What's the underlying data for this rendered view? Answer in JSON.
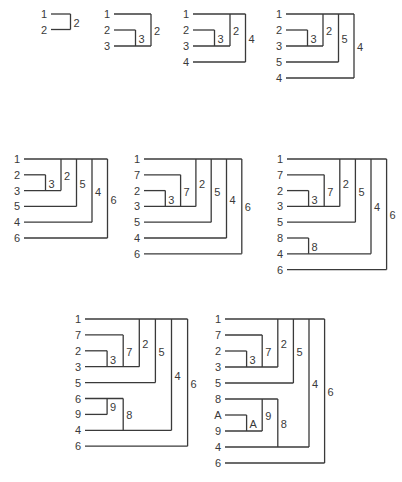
{
  "title": "",
  "diagrams": [
    {
      "rows": [
        "1",
        "2"
      ],
      "brackets": [
        {
          "label": "2",
          "top": 0,
          "bottom": 1,
          "level": 1
        }
      ]
    },
    {
      "rows": [
        "1",
        "2",
        "3"
      ],
      "brackets": [
        {
          "label": "3",
          "top": 1,
          "bottom": 2,
          "level": 1
        },
        {
          "label": "2",
          "top": 0,
          "bottom": 2,
          "level": 2
        }
      ]
    },
    {
      "rows": [
        "1",
        "2",
        "3",
        "4"
      ],
      "brackets": [
        {
          "label": "3",
          "top": 1,
          "bottom": 2,
          "level": 1
        },
        {
          "label": "2",
          "top": 0,
          "bottom": 2,
          "level": 2
        },
        {
          "label": "4",
          "top": 0,
          "bottom": 3,
          "level": 3
        }
      ]
    },
    {
      "rows": [
        "1",
        "2",
        "3",
        "5",
        "4"
      ],
      "brackets": [
        {
          "label": "3",
          "top": 1,
          "bottom": 2,
          "level": 1
        },
        {
          "label": "2",
          "top": 0,
          "bottom": 2,
          "level": 2
        },
        {
          "label": "5",
          "top": 0,
          "bottom": 3,
          "level": 3
        },
        {
          "label": "4",
          "top": 0,
          "bottom": 4,
          "level": 4
        }
      ]
    },
    {
      "rows": [
        "1",
        "2",
        "3",
        "5",
        "4",
        "6"
      ],
      "brackets": [
        {
          "label": "3",
          "top": 1,
          "bottom": 2,
          "level": 1
        },
        {
          "label": "2",
          "top": 0,
          "bottom": 2,
          "level": 2
        },
        {
          "label": "5",
          "top": 0,
          "bottom": 3,
          "level": 3
        },
        {
          "label": "4",
          "top": 0,
          "bottom": 4,
          "level": 4
        },
        {
          "label": "6",
          "top": 0,
          "bottom": 5,
          "level": 5
        }
      ]
    },
    {
      "rows": [
        "1",
        "7",
        "2",
        "3",
        "5",
        "4",
        "6"
      ],
      "brackets": [
        {
          "label": "3",
          "top": 2,
          "bottom": 3,
          "level": 1
        },
        {
          "label": "7",
          "top": 1,
          "bottom": 3,
          "level": 2
        },
        {
          "label": "2",
          "top": 0,
          "bottom": 3,
          "level": 3
        },
        {
          "label": "5",
          "top": 0,
          "bottom": 4,
          "level": 4
        },
        {
          "label": "4",
          "top": 0,
          "bottom": 5,
          "level": 5
        },
        {
          "label": "6",
          "top": 0,
          "bottom": 6,
          "level": 6
        }
      ]
    },
    {
      "rows": [
        "1",
        "7",
        "2",
        "3",
        "5",
        "8",
        "4",
        "6"
      ],
      "brackets": [
        {
          "label": "3",
          "top": 2,
          "bottom": 3,
          "level": 1
        },
        {
          "label": "7",
          "top": 1,
          "bottom": 3,
          "level": 2
        },
        {
          "label": "2",
          "top": 0,
          "bottom": 3,
          "level": 3
        },
        {
          "label": "5",
          "top": 0,
          "bottom": 4,
          "level": 4
        },
        {
          "label": "8",
          "top": 5,
          "bottom": 6,
          "level": 1
        },
        {
          "label": "4",
          "top": 0,
          "bottom": 6,
          "level": 5
        },
        {
          "label": "6",
          "top": 0,
          "bottom": 7,
          "level": 6
        }
      ]
    },
    {
      "rows": [
        "1",
        "7",
        "2",
        "3",
        "5",
        "6",
        "9",
        "4",
        "6"
      ],
      "brackets": [
        {
          "label": "3",
          "top": 2,
          "bottom": 3,
          "level": 1
        },
        {
          "label": "7",
          "top": 1,
          "bottom": 3,
          "level": 2
        },
        {
          "label": "2",
          "top": 0,
          "bottom": 3,
          "level": 3
        },
        {
          "label": "5",
          "top": 0,
          "bottom": 4,
          "level": 4
        },
        {
          "label": "9",
          "top": 5,
          "bottom": 6,
          "level": 1
        },
        {
          "label": "8",
          "top": 5,
          "bottom": 7,
          "level": 2
        },
        {
          "label": "4",
          "top": 0,
          "bottom": 7,
          "level": 5
        },
        {
          "label": "6",
          "top": 0,
          "bottom": 8,
          "level": 6
        }
      ]
    },
    {
      "rows": [
        "1",
        "7",
        "2",
        "3",
        "5",
        "8",
        "A",
        "9",
        "4",
        "6"
      ],
      "brackets": [
        {
          "label": "3",
          "top": 2,
          "bottom": 3,
          "level": 1
        },
        {
          "label": "7",
          "top": 1,
          "bottom": 3,
          "level": 2
        },
        {
          "label": "2",
          "top": 0,
          "bottom": 3,
          "level": 3
        },
        {
          "label": "5",
          "top": 0,
          "bottom": 4,
          "level": 4
        },
        {
          "label": "A",
          "top": 6,
          "bottom": 7,
          "level": 1
        },
        {
          "label": "9",
          "top": 5,
          "bottom": 7,
          "level": 2
        },
        {
          "label": "8",
          "top": 5,
          "bottom": 8,
          "level": 3
        },
        {
          "label": "4",
          "top": 0,
          "bottom": 8,
          "level": 5
        },
        {
          "label": "6",
          "top": 0,
          "bottom": 9,
          "level": 6
        }
      ]
    }
  ]
}
